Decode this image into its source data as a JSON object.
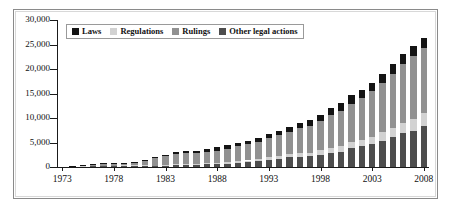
{
  "chart_data": {
    "type": "bar",
    "stacked": true,
    "title": "",
    "xlabel": "",
    "ylabel": "",
    "ylim": [
      0,
      30000
    ],
    "ytick_labels": [
      "0",
      "5,000",
      "10,000",
      "15,000",
      "20,000",
      "25,000",
      "30,000"
    ],
    "ytick_values": [
      0,
      5000,
      10000,
      15000,
      20000,
      25000,
      30000
    ],
    "xtick_labels": [
      "1973",
      "1978",
      "1983",
      "1988",
      "1993",
      "1998",
      "2003",
      "2008"
    ],
    "xtick_values": [
      1973,
      1978,
      1983,
      1988,
      1993,
      1998,
      2003,
      2008
    ],
    "grid": false,
    "legend_position": "top-left",
    "x": [
      1974,
      1975,
      1976,
      1977,
      1978,
      1979,
      1980,
      1981,
      1982,
      1983,
      1984,
      1985,
      1986,
      1987,
      1988,
      1989,
      1990,
      1991,
      1992,
      1993,
      1994,
      1995,
      1996,
      1997,
      1998,
      1999,
      2000,
      2001,
      2002,
      2003,
      2004,
      2005,
      2006,
      2007,
      2008
    ],
    "categories": [
      "1974",
      "1975",
      "1976",
      "1977",
      "1978",
      "1979",
      "1980",
      "1981",
      "1982",
      "1983",
      "1984",
      "1985",
      "1986",
      "1987",
      "1988",
      "1989",
      "1990",
      "1991",
      "1992",
      "1993",
      "1994",
      "1995",
      "1996",
      "1997",
      "1998",
      "1999",
      "2000",
      "2001",
      "2002",
      "2003",
      "2004",
      "2005",
      "2006",
      "2007",
      "2008"
    ],
    "series": [
      {
        "name": "Other legal actions",
        "color": "#4d4d4d",
        "values": [
          60,
          120,
          150,
          180,
          200,
          230,
          260,
          300,
          180,
          200,
          430,
          480,
          500,
          560,
          620,
          700,
          820,
          950,
          1150,
          1450,
          1700,
          1950,
          2100,
          2150,
          2500,
          2950,
          3050,
          3800,
          4200,
          4600,
          5350,
          6200,
          6950,
          7450,
          8450
        ]
      },
      {
        "name": "Regulations",
        "color": "#d2d2d2",
        "values": [
          20,
          40,
          50,
          60,
          70,
          80,
          90,
          110,
          120,
          150,
          170,
          190,
          210,
          240,
          270,
          300,
          340,
          380,
          430,
          500,
          560,
          620,
          680,
          740,
          900,
          1000,
          1150,
          1250,
          1380,
          1500,
          1700,
          1850,
          2050,
          2250,
          2500
        ]
      },
      {
        "name": "Rulings",
        "color": "#919191",
        "values": [
          50,
          180,
          220,
          330,
          380,
          440,
          560,
          800,
          1550,
          1800,
          2000,
          2100,
          2150,
          2350,
          2450,
          2700,
          3100,
          3300,
          3500,
          3900,
          4200,
          4600,
          5100,
          5550,
          6000,
          6600,
          7200,
          7900,
          8600,
          9400,
          10100,
          11000,
          12000,
          12900,
          13400
        ]
      },
      {
        "name": "Laws",
        "color": "#141414",
        "values": [
          20,
          60,
          80,
          130,
          150,
          150,
          190,
          290,
          250,
          350,
          400,
          430,
          440,
          450,
          660,
          700,
          740,
          770,
          820,
          850,
          900,
          1030,
          1120,
          1160,
          1200,
          1450,
          1600,
          1650,
          1620,
          1700,
          1750,
          1950,
          2100,
          2200,
          1950
        ]
      }
    ],
    "totals": [
      150,
      400,
      500,
      700,
      800,
      900,
      1100,
      1500,
      2100,
      2500,
      3000,
      3200,
      3300,
      3600,
      4000,
      4400,
      5000,
      5400,
      5900,
      6700,
      7360,
      8200,
      9000,
      9600,
      10600,
      12000,
      13000,
      14600,
      15800,
      17200,
      18900,
      21000,
      23100,
      24800,
      26300
    ]
  },
  "legend": {
    "items": [
      {
        "label": "Laws",
        "color": "#141414",
        "swatch": "legend-swatch-laws"
      },
      {
        "label": "Regulations",
        "color": "#d2d2d2",
        "swatch": "legend-swatch-regulations"
      },
      {
        "label": "Rulings",
        "color": "#919191",
        "swatch": "legend-swatch-rulings"
      },
      {
        "label": "Other legal actions",
        "color": "#4d4d4d",
        "swatch": "legend-swatch-other"
      }
    ]
  }
}
